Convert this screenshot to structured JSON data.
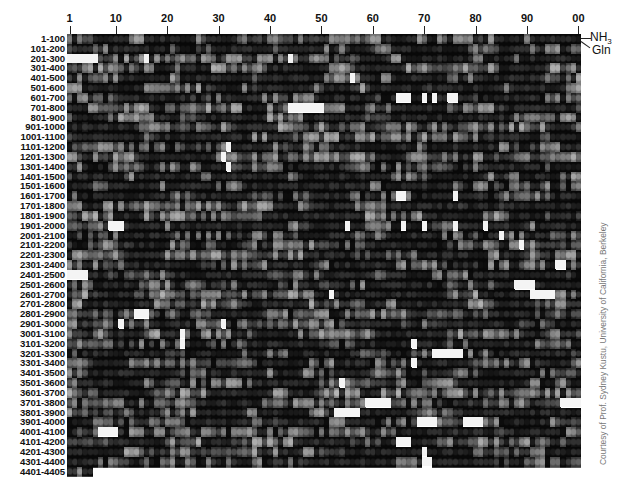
{
  "figure": {
    "column_axis": {
      "ticks": [
        {
          "label": "1",
          "col": 1
        },
        {
          "label": "10",
          "col": 10
        },
        {
          "label": "20",
          "col": 20
        },
        {
          "label": "30",
          "col": 30
        },
        {
          "label": "40",
          "col": 40
        },
        {
          "label": "50",
          "col": 50
        },
        {
          "label": "60",
          "col": 60
        },
        {
          "label": "70",
          "col": 70
        },
        {
          "label": "80",
          "col": 80
        },
        {
          "label": "90",
          "col": 90
        },
        {
          "label": "00",
          "col": 100
        }
      ],
      "columns": 100
    },
    "row_labels": [
      "1-100",
      "101-200",
      "201-300",
      "301-400",
      "401-500",
      "501-600",
      "601-700",
      "701-800",
      "801-900",
      "901-1000",
      "1001-1100",
      "1101-1200",
      "1201-1300",
      "1301-1400",
      "1401-1500",
      "1501-1600",
      "1601-1700",
      "1701-1800",
      "1801-1900",
      "1901-2000",
      "2001-2100",
      "2101-2200",
      "2201-2300",
      "2301-2400",
      "2401-2500",
      "2501-2600",
      "2601-2700",
      "2701-2800",
      "2801-2900",
      "2901-3000",
      "3001-3100",
      "3101-3200",
      "3201-3300",
      "3301-3400",
      "3401-3500",
      "3501-3600",
      "3601-3700",
      "3701-3800",
      "3801-3900",
      "3901-4000",
      "4001-4100",
      "4101-4200",
      "4201-4300",
      "4301-4400",
      "4401-4405"
    ],
    "last_row_columns": 5,
    "legend": {
      "top_label": "NH",
      "top_label_sub": "3",
      "bottom_label": "Gln"
    },
    "missing_blocks": [
      {
        "row": 2,
        "from": 1,
        "to": 6
      },
      {
        "row": 2,
        "from": 16,
        "to": 16
      },
      {
        "row": 2,
        "from": 44,
        "to": 44
      },
      {
        "row": 4,
        "from": 56,
        "to": 56
      },
      {
        "row": 6,
        "from": 65,
        "to": 67
      },
      {
        "row": 6,
        "from": 70,
        "to": 70
      },
      {
        "row": 6,
        "from": 72,
        "to": 72
      },
      {
        "row": 6,
        "from": 75,
        "to": 76
      },
      {
        "row": 7,
        "from": 44,
        "to": 50
      },
      {
        "row": 11,
        "from": 32,
        "to": 32
      },
      {
        "row": 12,
        "from": 31,
        "to": 31
      },
      {
        "row": 13,
        "from": 32,
        "to": 32
      },
      {
        "row": 16,
        "from": 65,
        "to": 66
      },
      {
        "row": 16,
        "from": 76,
        "to": 76
      },
      {
        "row": 19,
        "from": 9,
        "to": 11
      },
      {
        "row": 19,
        "from": 55,
        "to": 55
      },
      {
        "row": 19,
        "from": 66,
        "to": 66
      },
      {
        "row": 19,
        "from": 70,
        "to": 70
      },
      {
        "row": 19,
        "from": 76,
        "to": 76
      },
      {
        "row": 19,
        "from": 82,
        "to": 82
      },
      {
        "row": 20,
        "from": 85,
        "to": 85
      },
      {
        "row": 21,
        "from": 89,
        "to": 89
      },
      {
        "row": 23,
        "from": 96,
        "to": 97
      },
      {
        "row": 24,
        "from": 1,
        "to": 4
      },
      {
        "row": 25,
        "from": 88,
        "to": 91
      },
      {
        "row": 26,
        "from": 52,
        "to": 52
      },
      {
        "row": 26,
        "from": 91,
        "to": 95
      },
      {
        "row": 28,
        "from": 14,
        "to": 16
      },
      {
        "row": 29,
        "from": 11,
        "to": 11
      },
      {
        "row": 29,
        "from": 31,
        "to": 31
      },
      {
        "row": 30,
        "from": 23,
        "to": 23
      },
      {
        "row": 31,
        "from": 23,
        "to": 23
      },
      {
        "row": 31,
        "from": 68,
        "to": 68
      },
      {
        "row": 32,
        "from": 72,
        "to": 77
      },
      {
        "row": 33,
        "from": 68,
        "to": 68
      },
      {
        "row": 35,
        "from": 54,
        "to": 54
      },
      {
        "row": 37,
        "from": 59,
        "to": 63
      },
      {
        "row": 37,
        "from": 97,
        "to": 100
      },
      {
        "row": 38,
        "from": 53,
        "to": 57
      },
      {
        "row": 39,
        "from": 69,
        "to": 72
      },
      {
        "row": 39,
        "from": 78,
        "to": 81
      },
      {
        "row": 40,
        "from": 7,
        "to": 10
      },
      {
        "row": 41,
        "from": 65,
        "to": 67
      },
      {
        "row": 42,
        "from": 70,
        "to": 70
      },
      {
        "row": 43,
        "from": 70,
        "to": 71
      }
    ],
    "credit": "Courtesy of Prof. Sydney Kustu, University of California, Berkeley"
  }
}
